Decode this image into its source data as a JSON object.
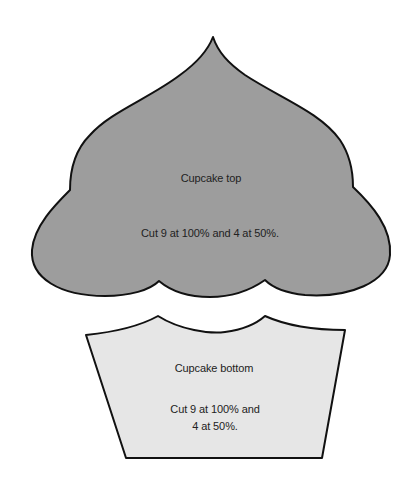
{
  "template": {
    "top": {
      "title": "Cupcake top",
      "instruction": "Cut 9 at 100% and 4 at 50%.",
      "fill": "#9d9d9d"
    },
    "bottom": {
      "title": "Cupcake bottom",
      "instruction_line1": "Cut 9 at 100% and",
      "instruction_line2": "4 at 50%.",
      "fill": "#e6e6e6"
    },
    "outline": "#111111"
  }
}
